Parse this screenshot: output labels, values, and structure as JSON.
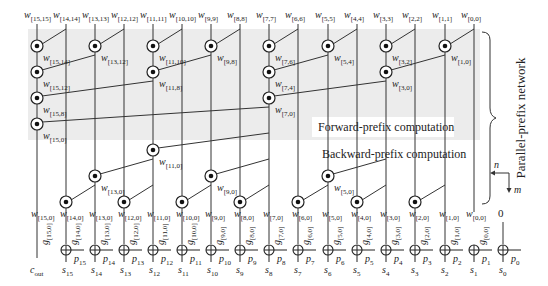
{
  "diagram": {
    "title_side": "Parallel-prefix network",
    "forward_label": "Forward-prefix  computation",
    "backward_label": "Backward-prefix computation",
    "axis": {
      "n": "n",
      "m": "m"
    },
    "colors": {
      "shade": "#ececec",
      "line": "#333333",
      "bg": "#ffffff"
    },
    "columns_x": [
      37,
      66,
      95,
      124,
      153,
      182,
      211,
      240,
      269,
      298,
      328,
      357,
      386,
      415,
      445,
      474
    ],
    "top_inputs": [
      "[15,15]",
      "[14,14]",
      "[13,13]",
      "[12,12]",
      "[11,11]",
      "[10,10]",
      "[9,9]",
      "[8,8]",
      "[7,7]",
      "[6,6]",
      "[5,5]",
      "[4,4]",
      "[3,3]",
      "[2,2]",
      "[1,1]",
      "[0,0]"
    ],
    "forward_nodes": [
      {
        "col": 0,
        "src": 1,
        "y": 46,
        "label": "[15,14]"
      },
      {
        "col": 2,
        "src": 3,
        "y": 46,
        "label": "[13,12]"
      },
      {
        "col": 4,
        "src": 5,
        "y": 46,
        "label": "[11,10]"
      },
      {
        "col": 6,
        "src": 7,
        "y": 46,
        "label": "[9,8]"
      },
      {
        "col": 8,
        "src": 9,
        "y": 46,
        "label": "[7,6]"
      },
      {
        "col": 10,
        "src": 11,
        "y": 46,
        "label": "[5,4]"
      },
      {
        "col": 12,
        "src": 13,
        "y": 46,
        "label": "[3,2]"
      },
      {
        "col": 14,
        "src": 15,
        "y": 46,
        "label": "[1,0]"
      },
      {
        "col": 0,
        "src": 2,
        "y": 72,
        "label": "[15,12]"
      },
      {
        "col": 4,
        "src": 6,
        "y": 72,
        "label": "[11,8]"
      },
      {
        "col": 8,
        "src": 10,
        "y": 72,
        "label": "[7,4]"
      },
      {
        "col": 12,
        "src": 14,
        "y": 72,
        "label": "[3,0]"
      },
      {
        "col": 0,
        "src": 4,
        "y": 98,
        "label": "[15,8]"
      },
      {
        "col": 8,
        "src": 12,
        "y": 98,
        "label": "[7,0]"
      },
      {
        "col": 0,
        "src": 8,
        "y": 124,
        "label": "[15,0]"
      }
    ],
    "backward_nodes": [
      {
        "col": 4,
        "src": 8,
        "y": 150,
        "label": "[11,0]"
      },
      {
        "col": 2,
        "src": 4,
        "y": 176,
        "label": "[13,0]"
      },
      {
        "col": 6,
        "src": 8,
        "y": 176,
        "label": "[9,0]"
      },
      {
        "col": 10,
        "src": 12,
        "y": 176,
        "label": "[5,0]"
      },
      {
        "col": 1,
        "src": 2,
        "y": 202,
        "label": ""
      },
      {
        "col": 3,
        "src": 4,
        "y": 202,
        "label": ""
      },
      {
        "col": 5,
        "src": 6,
        "y": 202,
        "label": ""
      },
      {
        "col": 7,
        "src": 8,
        "y": 202,
        "label": ""
      },
      {
        "col": 9,
        "src": 10,
        "y": 202,
        "label": ""
      },
      {
        "col": 11,
        "src": 12,
        "y": 202,
        "label": ""
      },
      {
        "col": 13,
        "src": 14,
        "y": 202,
        "label": ""
      }
    ],
    "bottom_w": [
      "[15,0]",
      "[14,0]",
      "[13,0]",
      "[12,0]",
      "[11,0]",
      "[10,0]",
      "[9,0]",
      "[8,0]",
      "[7,0]",
      "[6,0]",
      "[5,0]",
      "[4,0]",
      "[3,0]",
      "[2,0]",
      "[1,0]",
      "[0,0]"
    ],
    "zero_label": "0",
    "g_labels": [
      "[15,0]",
      "[14,0]",
      "[13,0]",
      "[12,0]",
      "[11,0]",
      "[10,0]",
      "[9,0]",
      "[8,0]",
      "[7,0]",
      "[6,0]",
      "[5,0]",
      "[4,0]",
      "[3,0]",
      "[2,0]",
      "[1,0]",
      "[0,0]"
    ],
    "p_labels": [
      "15",
      "14",
      "13",
      "12",
      "11",
      "10",
      "9",
      "8",
      "7",
      "6",
      "5",
      "4",
      "3",
      "2",
      "1",
      "0"
    ],
    "s_labels": [
      "15",
      "14",
      "13",
      "12",
      "11",
      "10",
      "9",
      "8",
      "7",
      "6",
      "5",
      "4",
      "3",
      "2",
      "1",
      "0"
    ],
    "cout_label": {
      "main": "c",
      "sub": "out"
    },
    "w_letter": "w",
    "g_letter": "g",
    "p_letter": "p",
    "s_letter": "s"
  }
}
